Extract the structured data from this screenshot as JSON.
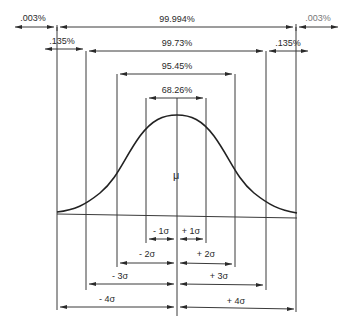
{
  "diagram": {
    "center_label": "μ",
    "colors": {
      "ink": "#2a2a2a",
      "background": "#ffffff"
    },
    "top_intervals": [
      {
        "label": "99.994%",
        "range": "±4σ"
      },
      {
        "label": "99.73%",
        "range": "±3σ"
      },
      {
        "label": "95.45%",
        "range": "±2σ"
      },
      {
        "label": "68.26%",
        "range": "±1σ"
      }
    ],
    "tails": {
      "outer_left": ".003%",
      "outer_right": ".003%",
      "inner_left": ".135%",
      "inner_right": ".135%"
    },
    "sigma_labels": {
      "minus": [
        "- 1σ",
        "- 2σ",
        "- 3σ",
        "- 4σ"
      ],
      "plus": [
        "+ 1σ",
        "+ 2σ",
        "+ 3σ",
        "+ 4σ"
      ]
    }
  }
}
